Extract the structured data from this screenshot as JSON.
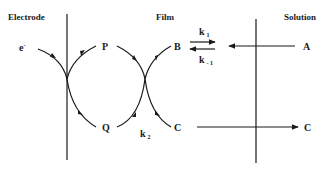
{
  "headers": {
    "electrode": "Electrode",
    "film": "Film",
    "solution": "Solution"
  },
  "species": {
    "electron": "e",
    "electron_sup": "-",
    "P": "P",
    "Q": "Q",
    "B": "B",
    "C_film": "C",
    "A": "A",
    "C_solution": "C"
  },
  "rate_constants": {
    "k1": "k",
    "k1_sub": "1",
    "k_minus1": "k",
    "k_minus1_sub": "- 1",
    "k2": "k",
    "k2_sub": "2"
  },
  "colors": {
    "stroke": "#1a1a1a",
    "background": "#ffffff"
  }
}
